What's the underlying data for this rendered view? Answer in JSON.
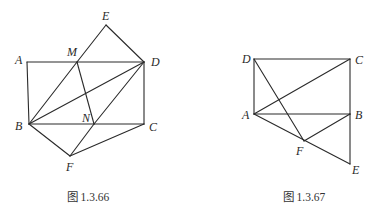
{
  "figures": [
    {
      "id": "fig-1-3-66",
      "caption": "图 1.3.66",
      "caption_pos": [
        88,
        201
      ],
      "points": {
        "A": {
          "x": 27,
          "y": 62,
          "label_x": 15,
          "label_y": 64
        },
        "M": {
          "x": 77,
          "y": 62,
          "label_x": 67,
          "label_y": 56
        },
        "E": {
          "x": 106,
          "y": 25,
          "label_x": 102,
          "label_y": 20
        },
        "D": {
          "x": 144,
          "y": 62,
          "label_x": 151,
          "label_y": 66
        },
        "B": {
          "x": 29,
          "y": 124,
          "label_x": 15,
          "label_y": 130
        },
        "N": {
          "x": 94,
          "y": 124,
          "label_x": 82,
          "label_y": 122
        },
        "C": {
          "x": 144,
          "y": 124,
          "label_x": 149,
          "label_y": 131
        },
        "F": {
          "x": 70,
          "y": 156,
          "label_x": 66,
          "label_y": 171
        }
      },
      "segments": [
        [
          "A",
          "D"
        ],
        [
          "A",
          "B"
        ],
        [
          "B",
          "C"
        ],
        [
          "C",
          "D"
        ],
        [
          "B",
          "M"
        ],
        [
          "M",
          "E"
        ],
        [
          "E",
          "D"
        ],
        [
          "B",
          "D"
        ],
        [
          "M",
          "N"
        ],
        [
          "N",
          "D"
        ],
        [
          "B",
          "F"
        ],
        [
          "F",
          "N"
        ],
        [
          "F",
          "C"
        ]
      ]
    },
    {
      "id": "fig-1-3-67",
      "caption": "图 1.3.67",
      "caption_pos": [
        304,
        201
      ],
      "points": {
        "D": {
          "x": 254,
          "y": 59,
          "label_x": 242,
          "label_y": 63
        },
        "C": {
          "x": 350,
          "y": 59,
          "label_x": 355,
          "label_y": 64
        },
        "A": {
          "x": 254,
          "y": 114,
          "label_x": 242,
          "label_y": 119
        },
        "B": {
          "x": 350,
          "y": 114,
          "label_x": 355,
          "label_y": 119
        },
        "F": {
          "x": 304,
          "y": 141,
          "label_x": 296,
          "label_y": 155
        },
        "E": {
          "x": 350,
          "y": 164,
          "label_x": 352,
          "label_y": 174
        }
      },
      "segments": [
        [
          "D",
          "C"
        ],
        [
          "D",
          "A"
        ],
        [
          "A",
          "B"
        ],
        [
          "C",
          "B"
        ],
        [
          "B",
          "E"
        ],
        [
          "A",
          "C"
        ],
        [
          "D",
          "F"
        ],
        [
          "A",
          "E"
        ],
        [
          "F",
          "B"
        ]
      ]
    }
  ]
}
